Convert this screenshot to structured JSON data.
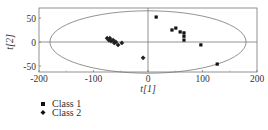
{
  "chart_data": {
    "type": "scatter",
    "title": "",
    "xlabel": "t[1]",
    "ylabel": "t[2]",
    "xlim": [
      -200,
      200
    ],
    "ylim": [
      -70,
      70
    ],
    "xticks": [
      -200,
      -100,
      0,
      100,
      200
    ],
    "yticks": [
      -50,
      0,
      50
    ],
    "grid": false,
    "reference_lines": {
      "x": 0,
      "y": 0
    },
    "ellipse": {
      "cx": 0,
      "cy": 0,
      "rx": 180,
      "ry": 65,
      "label": "Hotelling T2 confidence ellipse"
    },
    "legend_position": "below-left",
    "series": [
      {
        "name": "Class 1",
        "marker": "square",
        "points": [
          [
            15,
            52
          ],
          [
            44,
            25
          ],
          [
            51,
            29
          ],
          [
            59,
            21
          ],
          [
            66,
            19
          ],
          [
            66,
            12
          ],
          [
            66,
            4
          ],
          [
            97,
            -6
          ],
          [
            127,
            -46
          ]
        ]
      },
      {
        "name": "Class 2",
        "marker": "diamond",
        "points": [
          [
            -75,
            8
          ],
          [
            -72,
            4
          ],
          [
            -70,
            8
          ],
          [
            -68,
            2
          ],
          [
            -64,
            4
          ],
          [
            -62,
            -2
          ],
          [
            -59,
            0
          ],
          [
            -55,
            -6
          ],
          [
            -48,
            -2
          ],
          [
            -9,
            -33
          ]
        ]
      }
    ]
  },
  "labels": {
    "x_axis": "t[1]",
    "y_axis": "t[2]",
    "x_ticks": [
      "-200",
      "-100",
      "0",
      "100",
      "200"
    ],
    "y_ticks": [
      "50",
      "0",
      "-50"
    ],
    "legend": [
      "Class 1",
      "Class 2"
    ]
  }
}
